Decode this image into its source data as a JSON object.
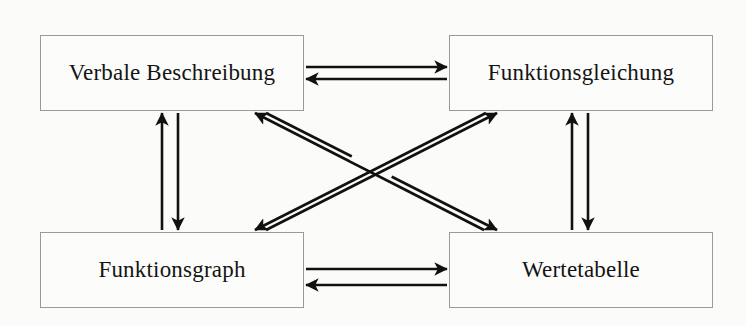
{
  "diagram": {
    "background_color": "#fbfbfa",
    "line_color": "#111111",
    "box_border_color": "#9a9a98",
    "box_fill_color": "#fcfcfb",
    "text_color": "#141414",
    "nodes": [
      {
        "id": "verbale-beschreibung",
        "label": "Verbale Beschreibung",
        "position": "top-left"
      },
      {
        "id": "funktionsgleichung",
        "label": "Funktionsgleichung",
        "position": "top-right"
      },
      {
        "id": "funktionsgraph",
        "label": "Funktionsgraph",
        "position": "bottom-left"
      },
      {
        "id": "wertetabelle",
        "label": "Wertetabelle",
        "position": "bottom-right"
      }
    ],
    "edges": [
      {
        "id": "edge-verbale-to-gleichung",
        "from": "verbale-beschreibung",
        "to": "funktionsgleichung",
        "direction": "bidirectional",
        "style": "horizontal-top"
      },
      {
        "id": "edge-graph-to-tabelle",
        "from": "funktionsgraph",
        "to": "wertetabelle",
        "direction": "bidirectional",
        "style": "horizontal-bottom"
      },
      {
        "id": "edge-verbale-to-graph",
        "from": "verbale-beschreibung",
        "to": "funktionsgraph",
        "direction": "bidirectional",
        "style": "vertical-left"
      },
      {
        "id": "edge-gleichung-to-tabelle",
        "from": "funktionsgleichung",
        "to": "wertetabelle",
        "direction": "bidirectional",
        "style": "vertical-right"
      },
      {
        "id": "edge-verbale-to-tabelle",
        "from": "verbale-beschreibung",
        "to": "wertetabelle",
        "direction": "bidirectional",
        "style": "diagonal-descending"
      },
      {
        "id": "edge-gleichung-to-graph",
        "from": "funktionsgleichung",
        "to": "funktionsgraph",
        "direction": "bidirectional",
        "style": "diagonal-ascending"
      }
    ]
  }
}
